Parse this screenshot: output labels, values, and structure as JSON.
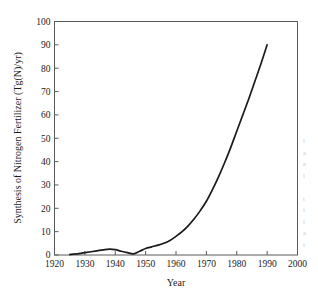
{
  "figure": {
    "name": "nitrogen-fertilizer-synthesis-line-chart",
    "background_color": "#ffffff",
    "line_color": "#1a1a1a",
    "axis_color": "#5a5a5a"
  },
  "chart_data": {
    "type": "line",
    "title": "",
    "xlabel": "Year",
    "ylabel": "Synthesis of Nitrogen Fertilizer (Tg(N)/yr)",
    "xlim": [
      1920,
      2000
    ],
    "ylim": [
      0,
      100
    ],
    "xticks": [
      1920,
      1930,
      1940,
      1950,
      1960,
      1970,
      1980,
      1990,
      2000
    ],
    "xticklabels": [
      "1920",
      "1930",
      "1940",
      "1950",
      "1960",
      "1970",
      "1980",
      "1990",
      "2000"
    ],
    "yticks": [
      0,
      10,
      20,
      30,
      40,
      50,
      60,
      70,
      80,
      90,
      100
    ],
    "yticklabels": [
      "0",
      "10",
      "20",
      "30",
      "40",
      "50",
      "60",
      "70",
      "80",
      "90",
      "100"
    ],
    "grid": false,
    "legend": false,
    "tick_direction": "in",
    "series": [
      {
        "name": "Synthesis of Nitrogen Fertilizer",
        "x": [
          1925,
          1928,
          1930,
          1932,
          1934,
          1936,
          1938,
          1940,
          1942,
          1944,
          1946,
          1948,
          1950,
          1952,
          1954,
          1956,
          1958,
          1960,
          1962,
          1964,
          1966,
          1968,
          1970,
          1972,
          1974,
          1976,
          1978,
          1980,
          1982,
          1984,
          1986,
          1988,
          1990
        ],
        "y": [
          0.2,
          0.6,
          1.0,
          1.4,
          1.8,
          2.2,
          2.5,
          2.3,
          1.6,
          1.0,
          0.5,
          1.6,
          2.8,
          3.5,
          4.2,
          5.0,
          6.2,
          8.0,
          10.0,
          12.5,
          15.5,
          19.0,
          23.0,
          28.0,
          33.5,
          39.5,
          46.0,
          53.0,
          60.0,
          67.0,
          74.5,
          82.0,
          90.0
        ]
      }
    ]
  },
  "margin_text": {
    "lines": [
      "l",
      "a",
      "e",
      "l",
      "",
      "t",
      "i",
      "l",
      "a",
      "i"
    ]
  }
}
